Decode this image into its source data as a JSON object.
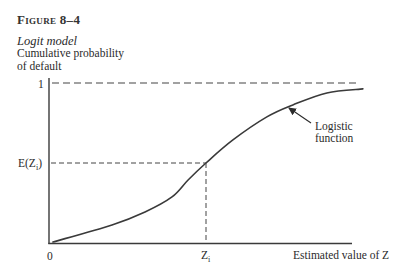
{
  "figure": {
    "number": "Figure 8–4",
    "title": "Logit model",
    "ylabel_line1": "Cumulative probability",
    "ylabel_line2": "of default"
  },
  "axes": {
    "x_label": "Estimated value of Z",
    "origin_label": "0",
    "y_tick_one": "1",
    "y_tick_expected": {
      "prefix": "E(Z",
      "sub": "i",
      "suffix": ")"
    },
    "x_tick_zi": {
      "main": "Z",
      "sub": "i"
    }
  },
  "annotation": {
    "line1": "Logistic",
    "line2": "function"
  },
  "colors": {
    "ink": "#333333",
    "background": "#ffffff"
  },
  "chart_data": {
    "type": "line",
    "title": "Logit model",
    "xlabel": "Estimated value of Z",
    "ylabel": "Cumulative probability of default",
    "xlim": [
      0,
      1
    ],
    "ylim": [
      0,
      1
    ],
    "grid": false,
    "legend": null,
    "y_ticks": [
      {
        "value": 0,
        "label": "0"
      },
      {
        "value": 0.5,
        "label": "E(Z_i)"
      },
      {
        "value": 1,
        "label": "1"
      }
    ],
    "x_ticks": [
      {
        "value": 0,
        "label": "0"
      },
      {
        "value": 0.518,
        "label": "Z_i"
      }
    ],
    "reference_lines": [
      {
        "orientation": "horizontal",
        "y": 1,
        "style": "dashed",
        "label": "asymptote at 1"
      },
      {
        "orientation": "horizontal",
        "y": 0.5,
        "x_to": 0.518,
        "style": "dashed"
      },
      {
        "orientation": "vertical",
        "x": 0.518,
        "y_to": 0.5,
        "style": "dashed"
      }
    ],
    "annotations": [
      {
        "text": "Logistic function",
        "arrow_to": {
          "x": 0.792,
          "y": 0.844
        }
      }
    ],
    "series": [
      {
        "name": "Logistic function",
        "x": [
          0.013,
          0.208,
          0.317,
          0.406,
          0.459,
          0.518,
          0.607,
          0.719,
          0.805,
          0.917,
          1.036
        ],
        "y": [
          0.006,
          0.113,
          0.194,
          0.288,
          0.394,
          0.5,
          0.644,
          0.788,
          0.863,
          0.938,
          0.963
        ]
      }
    ]
  }
}
